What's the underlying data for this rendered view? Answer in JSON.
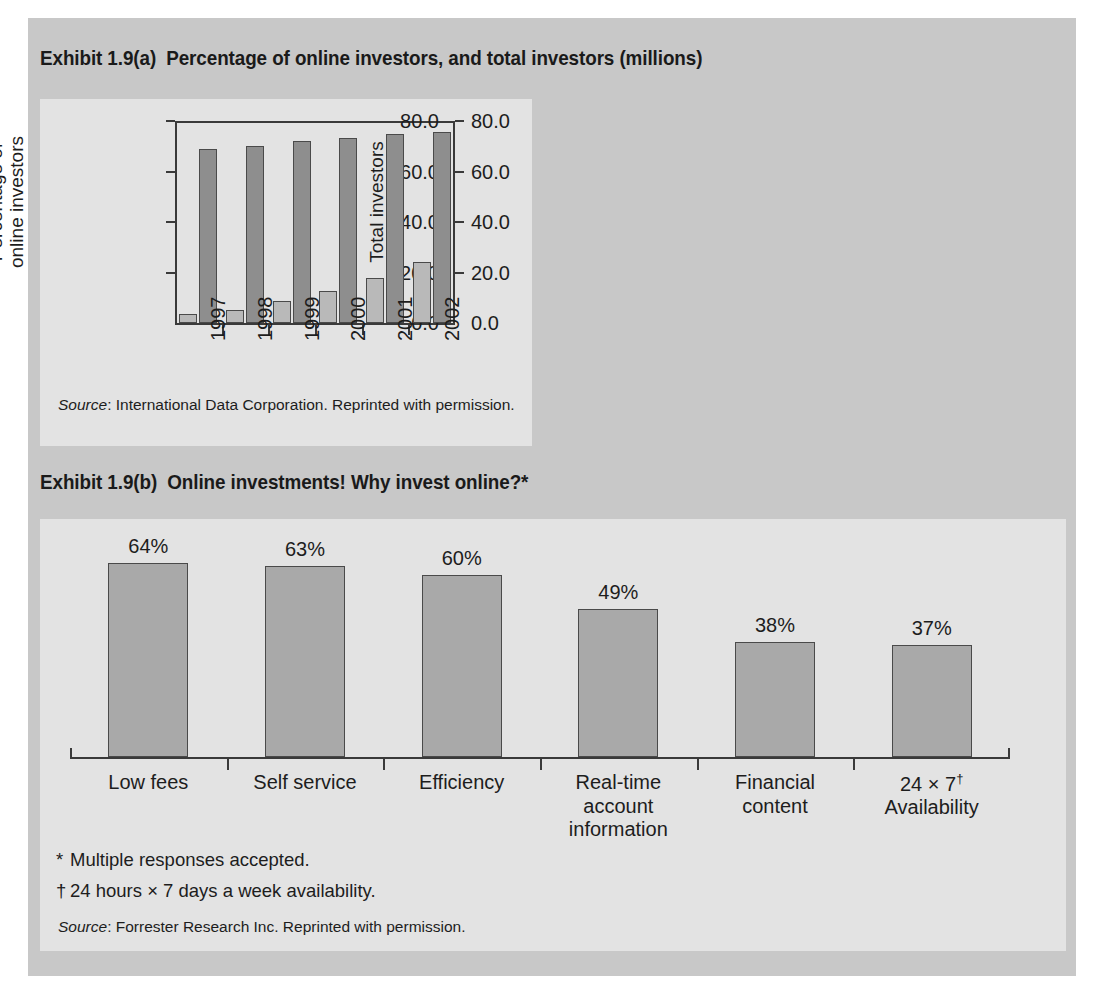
{
  "figure": {
    "page_bg": "#c8c8c8",
    "panel_bg": "#e3e3e3",
    "ink": "#1d1d1d"
  },
  "exhibit_a": {
    "number": "Exhibit 1.9(a)",
    "title": "Percentage of online investors, and total investors (millions)",
    "source_prefix": "Source",
    "source_text": ": International Data Corporation. Reprinted with permission."
  },
  "exhibit_b": {
    "number": "Exhibit 1.9(b)",
    "title": "Online investments! Why invest online?*",
    "footnote_1_mark": "*",
    "footnote_1_text": "Multiple responses accepted.",
    "footnote_2_mark": "†",
    "footnote_2_text": "24 hours × 7 days a week availability.",
    "source_prefix": "Source",
    "source_text": ": Forrester Research Inc. Reprinted with permission."
  },
  "chart_data": [
    {
      "type": "bar",
      "title": "Percentage of online investors, and total investors (millions)",
      "categories": [
        "1997",
        "1998",
        "1999",
        "2000",
        "2001",
        "2002"
      ],
      "series": [
        {
          "name": "Percentage of online investors",
          "axis": "left",
          "color": "#b9b9b9",
          "values": [
            3.5,
            5.2,
            8.8,
            12.8,
            17.9,
            24.3
          ]
        },
        {
          "name": "Total investors",
          "axis": "right",
          "color": "#8e8e8e",
          "values": [
            68.8,
            70.2,
            71.9,
            73.4,
            74.7,
            75.8
          ]
        }
      ],
      "xlabel": "",
      "ylabel": "Percentage of\nonline investors",
      "y2label": "Total investors",
      "ylim": [
        0,
        80
      ],
      "y2lim": [
        0,
        80
      ],
      "yticks": [
        "0.0",
        "20.0",
        "40.0",
        "60.0",
        "80.0"
      ],
      "y2ticks": [
        "0.0",
        "20.0",
        "40.0",
        "60.0",
        "80.0"
      ],
      "grid": false,
      "legend": "none"
    },
    {
      "type": "bar",
      "title": "Online investments! Why invest online?*",
      "categories": [
        "Low fees",
        "Self service",
        "Efficiency",
        "Real-time\naccount\ninformation",
        "Financial\ncontent",
        "24 × 7†\nAvailability"
      ],
      "values": [
        64,
        63,
        60,
        49,
        38,
        37
      ],
      "value_labels": [
        "64%",
        "63%",
        "60%",
        "49%",
        "38%",
        "37%"
      ],
      "bar_color": "#a9a9a9",
      "xlabel": "",
      "ylabel": "",
      "ylim": [
        0,
        72
      ],
      "grid": false,
      "legend": "none"
    }
  ]
}
